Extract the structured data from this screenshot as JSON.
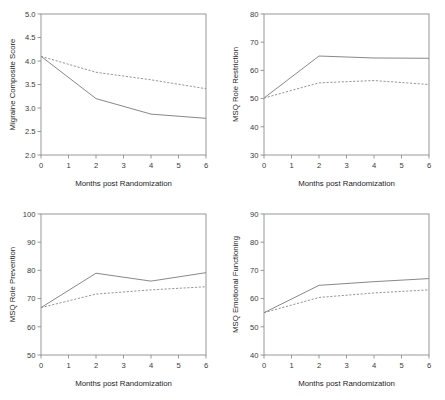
{
  "figure": {
    "panel_count": 4,
    "shared_xlabel": "Months post Randomization",
    "line_colors": {
      "solid": "#7a7a7a",
      "dashed": "#8a8a8a"
    },
    "background": "#ffffff"
  },
  "chart_data": [
    {
      "type": "line",
      "title": "",
      "xlabel": "Months post Randomization",
      "ylabel": "Migraine Composite Score",
      "x": [
        0,
        1,
        2,
        3,
        4,
        5,
        6
      ],
      "xlim": [
        0,
        6
      ],
      "xticks": [
        0,
        1,
        2,
        3,
        4,
        5,
        6
      ],
      "xticklabels": [
        "0",
        "1",
        "2",
        "3",
        "4",
        "5",
        "6"
      ],
      "ylim": [
        2.0,
        5.0
      ],
      "yticks": [
        2.0,
        2.5,
        3.0,
        3.5,
        4.0,
        4.5,
        5.0
      ],
      "yticklabels": [
        "2.0",
        "2.5",
        "3.0",
        "3.5",
        "4.0",
        "4.5",
        "5.0"
      ],
      "grid": false,
      "legend": "none",
      "series": [
        {
          "name": "solid",
          "style": "solid",
          "x": [
            0,
            2,
            4,
            6
          ],
          "values": [
            4.1,
            3.2,
            2.87,
            2.78
          ]
        },
        {
          "name": "dashed",
          "style": "dashed",
          "x": [
            0,
            2,
            4,
            6
          ],
          "values": [
            4.1,
            3.76,
            3.6,
            3.41
          ]
        }
      ]
    },
    {
      "type": "line",
      "title": "",
      "xlabel": "Months post Randomization",
      "ylabel": "MSQ Role Restriction",
      "x": [
        0,
        1,
        2,
        3,
        4,
        5,
        6
      ],
      "xlim": [
        0,
        6
      ],
      "xticks": [
        0,
        1,
        2,
        3,
        4,
        5,
        6
      ],
      "xticklabels": [
        "0",
        "1",
        "2",
        "3",
        "4",
        "5",
        "6"
      ],
      "ylim": [
        30,
        80
      ],
      "yticks": [
        30,
        40,
        50,
        60,
        70,
        80
      ],
      "yticklabels": [
        "30",
        "40",
        "50",
        "60",
        "70",
        "80"
      ],
      "grid": false,
      "legend": "none",
      "series": [
        {
          "name": "solid",
          "style": "solid",
          "x": [
            0,
            2,
            4,
            6
          ],
          "values": [
            50.2,
            65.1,
            64.4,
            64.3
          ]
        },
        {
          "name": "dashed",
          "style": "dashed",
          "x": [
            0,
            2,
            4,
            6
          ],
          "values": [
            50.2,
            55.6,
            56.4,
            55.0
          ]
        }
      ]
    },
    {
      "type": "line",
      "title": "",
      "xlabel": "Months post Randomization",
      "ylabel": "MSQ Role Prevention",
      "x": [
        0,
        1,
        2,
        3,
        4,
        5,
        6
      ],
      "xlim": [
        0,
        6
      ],
      "xticks": [
        0,
        1,
        2,
        3,
        4,
        5,
        6
      ],
      "xticklabels": [
        "0",
        "1",
        "2",
        "3",
        "4",
        "5",
        "6"
      ],
      "ylim": [
        50,
        100
      ],
      "yticks": [
        50,
        60,
        70,
        80,
        90,
        100
      ],
      "yticklabels": [
        "50",
        "60",
        "70",
        "80",
        "90",
        "100"
      ],
      "grid": false,
      "legend": "none",
      "series": [
        {
          "name": "solid",
          "style": "solid",
          "x": [
            0,
            2,
            4,
            6
          ],
          "values": [
            66.8,
            79.0,
            76.2,
            79.2
          ]
        },
        {
          "name": "dashed",
          "style": "dashed",
          "x": [
            0,
            2,
            4,
            6
          ],
          "values": [
            66.8,
            71.6,
            73.1,
            74.2
          ]
        }
      ]
    },
    {
      "type": "line",
      "title": "",
      "xlabel": "Months post Randomization",
      "ylabel": "MSQ Emotional Functioning",
      "x": [
        0,
        1,
        2,
        3,
        4,
        5,
        6
      ],
      "xlim": [
        0,
        6
      ],
      "xticks": [
        0,
        1,
        2,
        3,
        4,
        5,
        6
      ],
      "xticklabels": [
        "0",
        "1",
        "2",
        "3",
        "4",
        "5",
        "6"
      ],
      "ylim": [
        40,
        90
      ],
      "yticks": [
        40,
        50,
        60,
        70,
        80,
        90
      ],
      "yticklabels": [
        "40",
        "50",
        "60",
        "70",
        "80",
        "90"
      ],
      "grid": false,
      "legend": "none",
      "series": [
        {
          "name": "solid",
          "style": "solid",
          "x": [
            0,
            2,
            4,
            6
          ],
          "values": [
            55.0,
            64.7,
            66.0,
            67.1
          ]
        },
        {
          "name": "dashed",
          "style": "dashed",
          "x": [
            0,
            2,
            4,
            6
          ],
          "values": [
            55.0,
            60.4,
            62.0,
            63.1
          ]
        }
      ]
    }
  ]
}
